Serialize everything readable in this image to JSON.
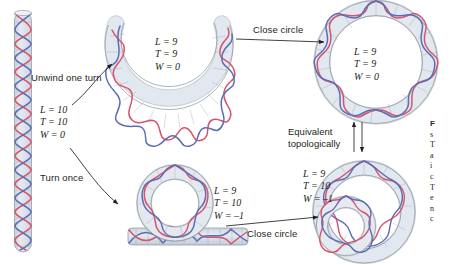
{
  "figure": {
    "domain": "molecular-biology-diagram"
  },
  "colors": {
    "strand_red": "#d9526b",
    "strand_blue": "#5c6cb4",
    "duplex_fill": "#dde3ea",
    "duplex_stroke": "#8a929c",
    "text": "#231f20",
    "arrow": "#231f20",
    "background": "#ffffff"
  },
  "structures": {
    "linear_duplex": {
      "name": "linear-dna-vertical",
      "equations": {
        "L": "L = 10",
        "T": "T = 10",
        "W": "W = 0"
      }
    },
    "open_horseshoe": {
      "name": "unwound-open-dna",
      "equations": {
        "L": "L = 9",
        "T": "T = 9",
        "W": "W = 0"
      }
    },
    "relaxed_circle": {
      "name": "closed-relaxed-circle",
      "equations": {
        "L": "L = 9",
        "T": "T = 9",
        "W": "W = 0"
      }
    },
    "writhed_lariat": {
      "name": "lariat-with-loop",
      "equations": {
        "L": "L = 9",
        "T": "T = 10",
        "W": "W = –1"
      }
    },
    "supercoiled_circle": {
      "name": "closed-supercoiled-circle",
      "equations": {
        "L": "L = 9",
        "T": "T = 10",
        "W": "W = –1"
      }
    }
  },
  "labels": {
    "unwind": "Unwind one turn",
    "turn_once": "Turn once",
    "close_circle_top": "Close circle",
    "close_circle_bottom": "Close circle",
    "equivalent_line1": "Equivalent",
    "equivalent_line2": "topologically"
  },
  "caption": {
    "title_fragment": "F",
    "lines": [
      "s",
      "T",
      "a",
      "i",
      "c",
      "T",
      "e",
      "n",
      "c"
    ]
  }
}
